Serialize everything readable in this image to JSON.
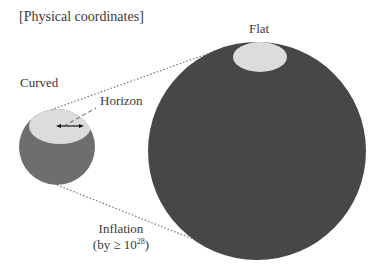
{
  "title": "[Physical coordinates]",
  "labels": {
    "curved": "Curved",
    "flat": "Flat",
    "horizon": "Horizon",
    "inflation_line1": "Inflation",
    "inflation_line2_prefix": "(by ≥ 10",
    "inflation_exponent": "28",
    "inflation_line2_suffix": ")"
  },
  "colors": {
    "small_sphere": "#6e6e6e",
    "large_sphere": "#4a4a4a",
    "horizon_patch": "#dcdcdc",
    "dotted_lines": "#777777",
    "text": "#3a3a3a"
  },
  "shapes": {
    "small_sphere": {
      "cx": 57,
      "cy": 147,
      "r": 38
    },
    "large_sphere": {
      "cx": 257,
      "cy": 151,
      "r": 109
    },
    "small_horizon_patch": {
      "cx": 60,
      "cy": 126,
      "rx": 31,
      "ry": 18
    },
    "large_horizon_patch": {
      "cx": 260,
      "cy": 57,
      "rx": 27,
      "ry": 15
    }
  }
}
